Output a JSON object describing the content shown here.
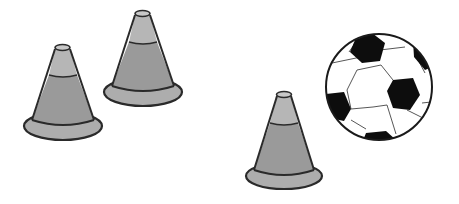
{
  "scene": {
    "description": "Three grey training cones and a black-and-white soccer ball on a white background",
    "colors": {
      "background": "#ffffff",
      "cone_light": "#b4b4b4",
      "cone_mid": "#9a9a9a",
      "cone_base": "#adadad",
      "outline": "#2a2a2a",
      "ball_white": "#ffffff",
      "ball_black": "#0d0d0d"
    },
    "objects": [
      {
        "name": "cone",
        "count": 3
      },
      {
        "name": "soccer-ball",
        "count": 1
      }
    ]
  }
}
